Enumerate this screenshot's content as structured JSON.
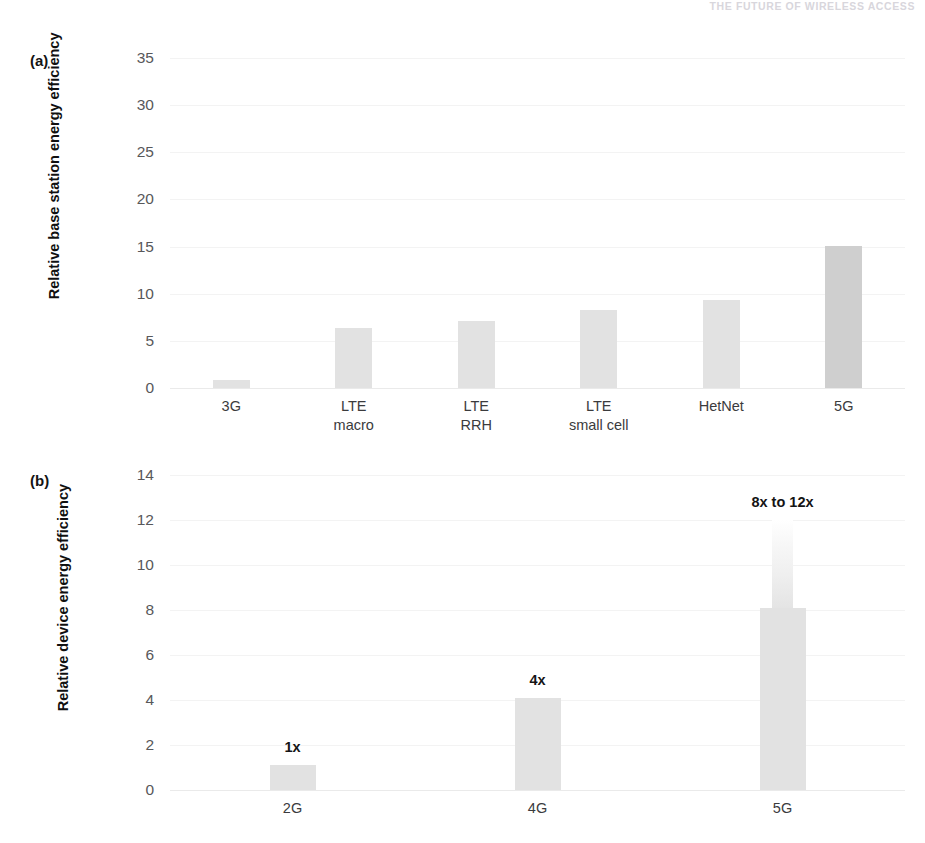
{
  "running_header": "THE FUTURE OF WIRELESS ACCESS",
  "panels": {
    "a": {
      "tag": "(a)",
      "axis_title": "Relative base station\nenergy efficiency"
    },
    "b": {
      "tag": "(b)",
      "axis_title": "Relative device\nenergy efficiency"
    }
  },
  "colors": {
    "bar": "#e2e2e2",
    "bar_accent": "#cfcfcf",
    "gridline": "#f3f3f3",
    "tick_text": "#58585a",
    "header_text": "#d8d6dc"
  },
  "chart_data": [
    {
      "type": "bar",
      "panel": "a",
      "title": "",
      "xlabel": "",
      "ylabel": "Relative base station energy efficiency",
      "ylim": [
        0,
        35
      ],
      "yticks": [
        0,
        5,
        10,
        15,
        20,
        25,
        30,
        35
      ],
      "ytick_labels": [
        "0",
        "5",
        "10",
        "15",
        "20",
        "25",
        "30",
        "35"
      ],
      "grid": true,
      "legend": "none",
      "categories": [
        "3G",
        "LTE\nmacro",
        "LTE\nRRH",
        "LTE\nsmall cell",
        "HetNet",
        "5G"
      ],
      "category_labels": [
        "3G",
        "LTE macro",
        "LTE RRH",
        "LTE small cell",
        "HetNet",
        "5G"
      ],
      "values": [
        0.8,
        6.4,
        7.1,
        8.3,
        9.3,
        15.1
      ],
      "highlight_index": 5
    },
    {
      "type": "bar",
      "panel": "b",
      "title": "",
      "xlabel": "",
      "ylabel": "Relative device energy efficiency",
      "ylim": [
        0,
        14
      ],
      "yticks": [
        0,
        2,
        4,
        6,
        8,
        10,
        12,
        14
      ],
      "ytick_labels": [
        "0",
        "2",
        "4",
        "6",
        "8",
        "10",
        "12",
        "14"
      ],
      "grid": true,
      "legend": "none",
      "categories": [
        "2G",
        "4G",
        "5G"
      ],
      "category_labels": [
        "2G",
        "4G",
        "5G"
      ],
      "values": [
        1.1,
        4.1,
        8.1
      ],
      "value_upper": [
        1.1,
        4.1,
        12.0
      ],
      "annotations": [
        "1x",
        "4x",
        "8x to 12x"
      ]
    }
  ]
}
